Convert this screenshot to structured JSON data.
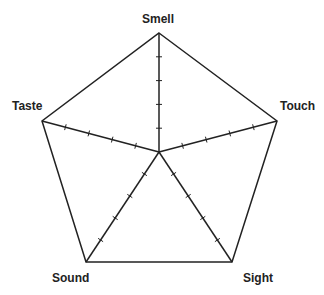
{
  "diagram": {
    "type": "radar-axes",
    "center": [
      159,
      152
    ],
    "ticks_per_axis": 4,
    "stroke_color": "#222222",
    "axes": [
      {
        "label": "Smell",
        "vertex": [
          159,
          33
        ]
      },
      {
        "label": "Touch",
        "vertex": [
          277,
          121
        ]
      },
      {
        "label": "Sight",
        "vertex": [
          232,
          262
        ]
      },
      {
        "label": "Sound",
        "vertex": [
          86,
          262
        ]
      },
      {
        "label": "Taste",
        "vertex": [
          42,
          121
        ]
      }
    ]
  }
}
